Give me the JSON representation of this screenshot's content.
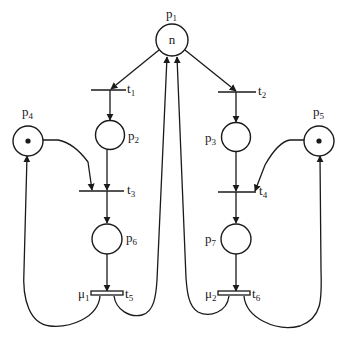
{
  "diagram": {
    "type": "petri-net",
    "colors": {
      "stroke": "#1a1a1a",
      "background": "#ffffff"
    },
    "places": [
      {
        "id": "p1",
        "label": "p",
        "sub": "1",
        "token": "n"
      },
      {
        "id": "p2",
        "label": "p",
        "sub": "2",
        "token": ""
      },
      {
        "id": "p3",
        "label": "p",
        "sub": "3",
        "token": ""
      },
      {
        "id": "p4",
        "label": "p",
        "sub": "4",
        "token": "•"
      },
      {
        "id": "p5",
        "label": "p",
        "sub": "5",
        "token": "•"
      },
      {
        "id": "p6",
        "label": "p",
        "sub": "6",
        "token": ""
      },
      {
        "id": "p7",
        "label": "p",
        "sub": "7",
        "token": ""
      }
    ],
    "transitions": [
      {
        "id": "t1",
        "label": "t",
        "sub": "1"
      },
      {
        "id": "t2",
        "label": "t",
        "sub": "2"
      },
      {
        "id": "t3",
        "label": "t",
        "sub": "3"
      },
      {
        "id": "t4",
        "label": "t",
        "sub": "4"
      },
      {
        "id": "t5",
        "label": "t",
        "sub": "5",
        "timed_label": "μ",
        "timed_sub": "1"
      },
      {
        "id": "t6",
        "label": "t",
        "sub": "6",
        "timed_label": "μ",
        "timed_sub": "2"
      }
    ],
    "arcs": [
      [
        "p1",
        "t1"
      ],
      [
        "p1",
        "t2"
      ],
      [
        "t1",
        "p2"
      ],
      [
        "t2",
        "p3"
      ],
      [
        "p2",
        "t3"
      ],
      [
        "p4",
        "t3"
      ],
      [
        "p3",
        "t4"
      ],
      [
        "p5",
        "t4"
      ],
      [
        "t3",
        "p6"
      ],
      [
        "t4",
        "p7"
      ],
      [
        "p6",
        "t5"
      ],
      [
        "p7",
        "t6"
      ],
      [
        "t5",
        "p4"
      ],
      [
        "t5",
        "p1"
      ],
      [
        "t6",
        "p1"
      ],
      [
        "t6",
        "p5"
      ]
    ]
  }
}
